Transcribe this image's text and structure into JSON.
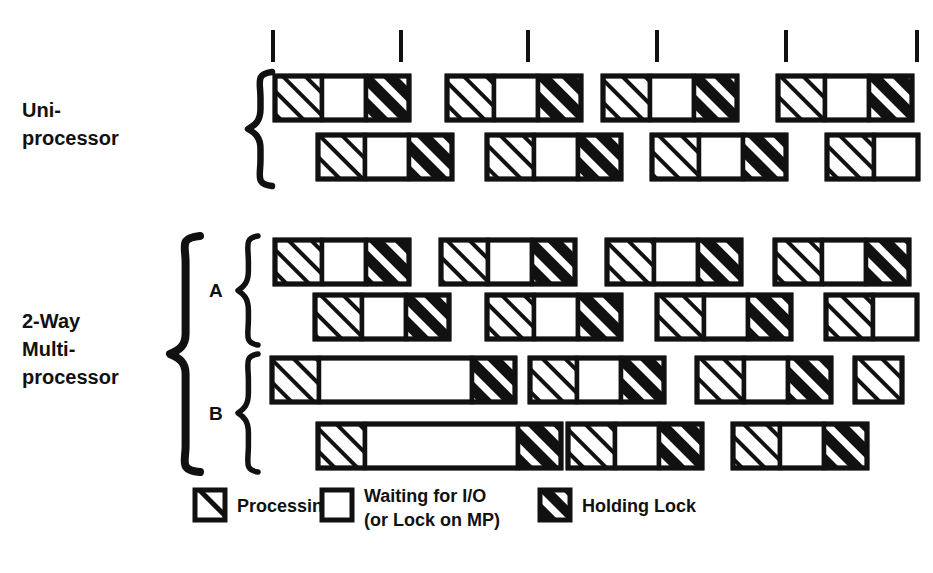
{
  "figure": {
    "background_color": "#ffffff",
    "ink_color": "#000000",
    "stroke_color": "#111111"
  },
  "labels": {
    "uniprocessor_line1": "Uni-",
    "uniprocessor_line2": "processor",
    "multiprocessor_line1": "2-Way",
    "multiprocessor_line2": "Multi-",
    "multiprocessor_line3": "processor",
    "cpu_a": "A",
    "cpu_b": "B"
  },
  "legend": {
    "items": [
      {
        "key": "processing",
        "label": "Processing",
        "swatch": "thin-diagonal-hatch"
      },
      {
        "key": "waiting",
        "label_line1": "Waiting for I/O",
        "label_line2": "(or Lock on MP)",
        "swatch": "empty-box"
      },
      {
        "key": "holding_lock",
        "label": "Holding Lock",
        "swatch": "thick-diagonal-hatch"
      }
    ]
  },
  "timeline": {
    "tick_count": 6,
    "tick_x": [
      273,
      401,
      528,
      657,
      786,
      917
    ],
    "tick_y_top": 30,
    "tick_y_bottom": 62
  },
  "chart_data": {
    "type": "timeline",
    "segment_types": [
      "processing",
      "waiting",
      "holding_lock"
    ],
    "bar_height": 44,
    "groups": [
      {
        "name": "Uni-processor",
        "subgroups": [
          {
            "name": "",
            "rows": [
              {
                "row": 1,
                "y": 76,
                "bars": [
                  {
                    "x": 275,
                    "segments": [
                      {
                        "type": "processing",
                        "width": 47
                      },
                      {
                        "type": "waiting",
                        "width": 44
                      },
                      {
                        "type": "holding_lock",
                        "width": 43
                      }
                    ]
                  },
                  {
                    "x": 447,
                    "segments": [
                      {
                        "type": "processing",
                        "width": 47
                      },
                      {
                        "type": "waiting",
                        "width": 44
                      },
                      {
                        "type": "holding_lock",
                        "width": 43
                      }
                    ]
                  },
                  {
                    "x": 603,
                    "segments": [
                      {
                        "type": "processing",
                        "width": 47
                      },
                      {
                        "type": "waiting",
                        "width": 44
                      },
                      {
                        "type": "holding_lock",
                        "width": 43
                      }
                    ]
                  },
                  {
                    "x": 778,
                    "segments": [
                      {
                        "type": "processing",
                        "width": 47
                      },
                      {
                        "type": "waiting",
                        "width": 44
                      },
                      {
                        "type": "holding_lock",
                        "width": 43
                      }
                    ]
                  }
                ]
              },
              {
                "row": 2,
                "y": 135,
                "bars": [
                  {
                    "x": 318,
                    "segments": [
                      {
                        "type": "processing",
                        "width": 47
                      },
                      {
                        "type": "waiting",
                        "width": 44
                      },
                      {
                        "type": "holding_lock",
                        "width": 43
                      }
                    ]
                  },
                  {
                    "x": 487,
                    "segments": [
                      {
                        "type": "processing",
                        "width": 47
                      },
                      {
                        "type": "waiting",
                        "width": 44
                      },
                      {
                        "type": "holding_lock",
                        "width": 43
                      }
                    ]
                  },
                  {
                    "x": 652,
                    "segments": [
                      {
                        "type": "processing",
                        "width": 47
                      },
                      {
                        "type": "waiting",
                        "width": 44
                      },
                      {
                        "type": "holding_lock",
                        "width": 43
                      }
                    ]
                  },
                  {
                    "x": 827,
                    "segments": [
                      {
                        "type": "processing",
                        "width": 47
                      },
                      {
                        "type": "waiting",
                        "width": 44
                      }
                    ]
                  }
                ]
              }
            ]
          }
        ]
      },
      {
        "name": "2-Way Multi-processor",
        "subgroups": [
          {
            "name": "A",
            "rows": [
              {
                "row": 1,
                "y": 240,
                "bars": [
                  {
                    "x": 275,
                    "segments": [
                      {
                        "type": "processing",
                        "width": 47
                      },
                      {
                        "type": "waiting",
                        "width": 44
                      },
                      {
                        "type": "holding_lock",
                        "width": 43
                      }
                    ]
                  },
                  {
                    "x": 441,
                    "segments": [
                      {
                        "type": "processing",
                        "width": 47
                      },
                      {
                        "type": "waiting",
                        "width": 44
                      },
                      {
                        "type": "holding_lock",
                        "width": 43
                      }
                    ]
                  },
                  {
                    "x": 607,
                    "segments": [
                      {
                        "type": "processing",
                        "width": 47
                      },
                      {
                        "type": "waiting",
                        "width": 44
                      },
                      {
                        "type": "holding_lock",
                        "width": 43
                      }
                    ]
                  },
                  {
                    "x": 775,
                    "segments": [
                      {
                        "type": "processing",
                        "width": 47
                      },
                      {
                        "type": "waiting",
                        "width": 44
                      },
                      {
                        "type": "holding_lock",
                        "width": 43
                      }
                    ]
                  }
                ]
              },
              {
                "row": 2,
                "y": 295,
                "bars": [
                  {
                    "x": 315,
                    "segments": [
                      {
                        "type": "processing",
                        "width": 47
                      },
                      {
                        "type": "waiting",
                        "width": 44
                      },
                      {
                        "type": "holding_lock",
                        "width": 43
                      }
                    ]
                  },
                  {
                    "x": 487,
                    "segments": [
                      {
                        "type": "processing",
                        "width": 47
                      },
                      {
                        "type": "waiting",
                        "width": 44
                      },
                      {
                        "type": "holding_lock",
                        "width": 43
                      }
                    ]
                  },
                  {
                    "x": 657,
                    "segments": [
                      {
                        "type": "processing",
                        "width": 47
                      },
                      {
                        "type": "waiting",
                        "width": 44
                      },
                      {
                        "type": "holding_lock",
                        "width": 43
                      }
                    ]
                  },
                  {
                    "x": 826,
                    "segments": [
                      {
                        "type": "processing",
                        "width": 47
                      },
                      {
                        "type": "waiting",
                        "width": 44
                      }
                    ]
                  }
                ]
              }
            ]
          },
          {
            "name": "B",
            "rows": [
              {
                "row": 1,
                "y": 358,
                "bars": [
                  {
                    "x": 272,
                    "segments": [
                      {
                        "type": "processing",
                        "width": 47
                      },
                      {
                        "type": "waiting",
                        "width": 153
                      },
                      {
                        "type": "holding_lock",
                        "width": 43
                      }
                    ]
                  },
                  {
                    "x": 530,
                    "segments": [
                      {
                        "type": "processing",
                        "width": 47
                      },
                      {
                        "type": "waiting",
                        "width": 44
                      },
                      {
                        "type": "holding_lock",
                        "width": 43
                      }
                    ]
                  },
                  {
                    "x": 697,
                    "segments": [
                      {
                        "type": "processing",
                        "width": 47
                      },
                      {
                        "type": "waiting",
                        "width": 44
                      },
                      {
                        "type": "holding_lock",
                        "width": 43
                      }
                    ]
                  },
                  {
                    "x": 855,
                    "segments": [
                      {
                        "type": "processing",
                        "width": 47
                      }
                    ]
                  }
                ]
              },
              {
                "row": 2,
                "y": 424,
                "bars": [
                  {
                    "x": 318,
                    "segments": [
                      {
                        "type": "processing",
                        "width": 47
                      },
                      {
                        "type": "waiting",
                        "width": 153
                      },
                      {
                        "type": "holding_lock",
                        "width": 43
                      }
                    ]
                  },
                  {
                    "x": 568,
                    "segments": [
                      {
                        "type": "processing",
                        "width": 47
                      },
                      {
                        "type": "waiting",
                        "width": 44
                      },
                      {
                        "type": "holding_lock",
                        "width": 43
                      }
                    ]
                  },
                  {
                    "x": 733,
                    "segments": [
                      {
                        "type": "processing",
                        "width": 47
                      },
                      {
                        "type": "waiting",
                        "width": 44
                      },
                      {
                        "type": "holding_lock",
                        "width": 43
                      }
                    ]
                  }
                ]
              }
            ]
          }
        ]
      }
    ]
  },
  "braces": [
    {
      "name": "uniprocessor-brace",
      "x": 248,
      "y_top": 72,
      "y_bottom": 186,
      "size": "large"
    },
    {
      "name": "multiprocessor-outer-brace",
      "x": 170,
      "y_top": 236,
      "y_bottom": 472,
      "size": "xlarge"
    },
    {
      "name": "cpu-a-brace",
      "x": 238,
      "y_top": 236,
      "y_bottom": 345,
      "size": "medium"
    },
    {
      "name": "cpu-b-brace",
      "x": 238,
      "y_top": 354,
      "y_bottom": 472,
      "size": "medium"
    }
  ],
  "legend_layout": {
    "y": 490,
    "swatch_size": 30,
    "items_x": [
      195,
      322,
      540
    ],
    "text_x": [
      237,
      364,
      582
    ]
  }
}
